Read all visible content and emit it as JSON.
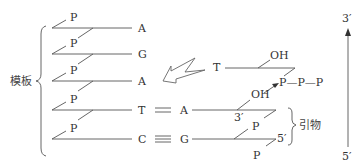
{
  "diagram": {
    "type": "DNA replication primer extension schematic",
    "template_label": "模板",
    "primer_label": "引物",
    "phosphate_label": "P",
    "hydroxyl_label": "OH",
    "template_bases": [
      "A",
      "G",
      "A",
      "T",
      "C"
    ],
    "primer_bases": [
      "A",
      "G"
    ],
    "pairings": [
      {
        "template": "T",
        "bond": "=",
        "primer": "A"
      },
      {
        "template": "C",
        "bond": "≡",
        "primer": "G"
      }
    ],
    "incoming_nucleotide": {
      "base": "T",
      "hydroxyl": "OH",
      "triphosphate": "P—P—P"
    },
    "primer_end_labels": {
      "three_prime": "3′",
      "five_prime": "5′"
    },
    "direction_axis": {
      "top": "3′",
      "bottom": "5′"
    },
    "colors": {
      "line": "#555555",
      "text": "#333333",
      "background": "#ffffff"
    }
  }
}
